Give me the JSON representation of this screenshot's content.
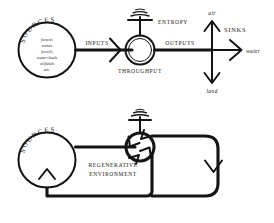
{
  "figure": {
    "style": "hand-drawn pen sketch",
    "ink_color": "#141414",
    "background_color": "#ffffff"
  },
  "diagram_top": {
    "name": "linear-throughput-economy",
    "sources_circle": {
      "arc_label": "SOURCES",
      "items": [
        "forests",
        "mines",
        "fossils",
        "watersheds",
        "oilfields",
        "etc."
      ]
    },
    "flow_labels": {
      "inputs": "INPUTS",
      "throughput": "THROUGHPUT",
      "outputs": "OUTPUTS",
      "entropy": "ENTROPY"
    },
    "sinks": {
      "label": "SINKS",
      "destinations": [
        {
          "name": "air",
          "direction": "up"
        },
        {
          "name": "water",
          "direction": "right"
        },
        {
          "name": "land",
          "direction": "down"
        }
      ]
    }
  },
  "diagram_bottom": {
    "name": "regenerative-circular-economy",
    "sources_circle": {
      "arc_label": "SOURCES"
    },
    "center_label_line_1": "REGENERATIVE",
    "center_label_line_2": "ENVIRONMENT",
    "entropy_symbol": "entropy",
    "loop": "closed recirculating feedback loop returning to sources"
  }
}
